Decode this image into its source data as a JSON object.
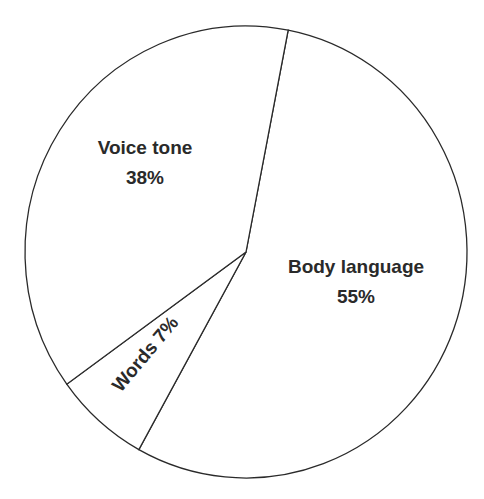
{
  "chart_data": {
    "type": "pie",
    "title": "",
    "categories": [
      "Body language",
      "Words",
      "Voice tone"
    ],
    "values": [
      55,
      7,
      38
    ],
    "labels": [
      {
        "name": "Body language",
        "value_text": "55%"
      },
      {
        "name": "Words",
        "value_text": "7%"
      },
      {
        "name": "Voice tone",
        "value_text": "38%"
      }
    ],
    "start_angle_deg_clockwise_from_top": 11,
    "legend": "none",
    "colors": {
      "fill": "#ffffff",
      "stroke": "#2a2a2a",
      "text": "#2a2a2a"
    }
  }
}
